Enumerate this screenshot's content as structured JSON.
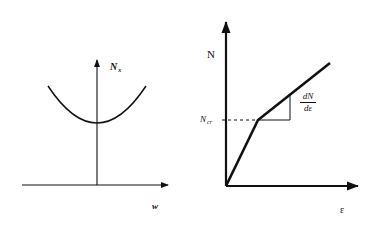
{
  "figure": {
    "left_plot": {
      "y_axis_label": "N",
      "y_axis_label_sub": "x",
      "x_axis_label": "w",
      "curve": "parabola",
      "description": "Load N_x versus deflection w, parabolic curve with minimum on vertical axis"
    },
    "right_plot": {
      "y_axis_label": "N",
      "x_axis_label": "ε",
      "critical_label": "N",
      "critical_label_sub": "cr",
      "slope_numerator": "dN",
      "slope_denominator": "dε",
      "curve": "bilinear",
      "description": "Load N versus strain ε, bilinear with kink at N_cr and slope triangle dN/dε"
    },
    "colors": {
      "line": "#111111",
      "background": "#ffffff"
    }
  }
}
